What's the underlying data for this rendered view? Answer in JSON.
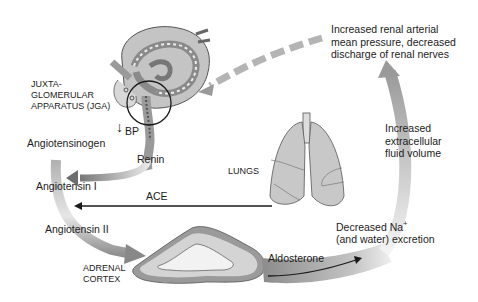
{
  "diagram": {
    "labels": {
      "jga": [
        "JUXTA-",
        "GLOMERULAR",
        "APPARATUS (JGA)"
      ],
      "bp": "BP",
      "bp_arrow": "↓",
      "angiotensinogen": "Angiotensinogen",
      "renin": "Renin",
      "angiotensin_1": "Angiotensin I",
      "ace": "ACE",
      "lungs": "LUNGS",
      "angiotensin_2": "Angiotensin II",
      "adrenal": [
        "ADRENAL",
        "CORTEX"
      ],
      "aldosterone": "Aldosterone",
      "decreased_na": "Decreased Na",
      "decreased_na_sup": "+",
      "decreased_na_2": "(and water) excretion",
      "increased_ecf": [
        "Increased",
        "extracellular",
        "fluid volume"
      ],
      "increased_pressure": [
        "Increased renal arterial",
        "mean pressure, decreased",
        "discharge of renal nerves"
      ]
    },
    "colors": {
      "organ_fill": "#c8c8c8",
      "organ_stroke": "#555555",
      "arrow_gray": "#8a8a8a",
      "text": "#1c1c1c"
    }
  }
}
